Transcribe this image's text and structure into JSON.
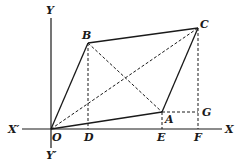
{
  "diagram": {
    "colors": {
      "ink": "#1a1a1a",
      "background": "#ffffff"
    },
    "axes": {
      "x_label": "X",
      "x_prime_label": "X′",
      "y_label": "Y",
      "y_prime_label": "Y′",
      "origin_label": "O"
    },
    "points": {
      "O": {
        "label": "O",
        "x": 51,
        "y": 129
      },
      "A": {
        "label": "A",
        "x": 162,
        "y": 112
      },
      "B": {
        "label": "B",
        "x": 88,
        "y": 43
      },
      "C": {
        "label": "C",
        "x": 198,
        "y": 28
      },
      "D": {
        "label": "D",
        "x": 88,
        "y": 129
      },
      "E": {
        "label": "E",
        "x": 162,
        "y": 129
      },
      "F": {
        "label": "F",
        "x": 198,
        "y": 129
      },
      "G": {
        "label": "G",
        "x": 198,
        "y": 112
      }
    },
    "solid_segments": [
      "OA",
      "AC",
      "CB",
      "BO"
    ],
    "dashed_segments": [
      "OC",
      "BA",
      "BD",
      "AE",
      "CF",
      "AG"
    ]
  }
}
